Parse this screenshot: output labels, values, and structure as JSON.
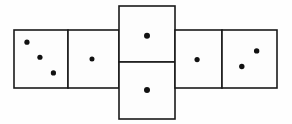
{
  "figure": {
    "title": "Cube net with dice pips",
    "type": "cube-net",
    "width": 292,
    "height": 124,
    "background_color": "#fefefe",
    "stroke_color": "#1a1a1a",
    "pip_color": "#111111",
    "stroke_width": 1.6,
    "total_faces": 6,
    "total_pips": 9
  },
  "faces": [
    {
      "id": "face-left-outer",
      "label": "three",
      "position": "row-left-outer",
      "pip_count": 3,
      "x": 14,
      "y": 30,
      "w": 54,
      "h": 58,
      "pips": [
        {
          "cx": 0.24,
          "cy": 0.21,
          "r": 2.6
        },
        {
          "cx": 0.48,
          "cy": 0.47,
          "r": 2.6
        },
        {
          "cx": 0.73,
          "cy": 0.74,
          "r": 2.6
        }
      ]
    },
    {
      "id": "face-left-inner",
      "label": "one",
      "position": "row-left-inner",
      "pip_count": 1,
      "x": 68,
      "y": 30,
      "w": 51,
      "h": 58,
      "pips": [
        {
          "cx": 0.47,
          "cy": 0.5,
          "r": 2.5
        }
      ]
    },
    {
      "id": "face-top",
      "label": "one",
      "position": "column-top",
      "pip_count": 1,
      "x": 119,
      "y": 6,
      "w": 56,
      "h": 56,
      "pips": [
        {
          "cx": 0.5,
          "cy": 0.53,
          "r": 3.0
        }
      ]
    },
    {
      "id": "face-bottom",
      "label": "one",
      "position": "column-bottom",
      "pip_count": 1,
      "x": 119,
      "y": 62,
      "w": 56,
      "h": 57,
      "pips": [
        {
          "cx": 0.5,
          "cy": 0.49,
          "r": 3.0
        }
      ]
    },
    {
      "id": "face-right-inner",
      "label": "one",
      "position": "row-right-inner",
      "pip_count": 1,
      "x": 175,
      "y": 30,
      "w": 47,
      "h": 58,
      "pips": [
        {
          "cx": 0.47,
          "cy": 0.51,
          "r": 2.6
        }
      ]
    },
    {
      "id": "face-right-outer",
      "label": "two",
      "position": "row-right-outer",
      "pip_count": 2,
      "x": 222,
      "y": 30,
      "w": 55,
      "h": 58,
      "pips": [
        {
          "cx": 0.63,
          "cy": 0.36,
          "r": 2.7
        },
        {
          "cx": 0.36,
          "cy": 0.63,
          "r": 2.7
        }
      ]
    }
  ],
  "caption": ""
}
